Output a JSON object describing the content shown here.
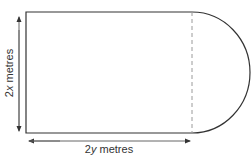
{
  "diagram": {
    "shape": "rectangle with semicircle attached to right side",
    "labels": {
      "height": "2x metres",
      "width": "2y metres"
    },
    "height_label_parts": {
      "coef": "2",
      "var": "x",
      "unit": " metres"
    },
    "width_label_parts": {
      "coef": "2",
      "var": "y",
      "unit": " metres"
    },
    "colors": {
      "stroke": "#333333",
      "dashed": "#999999",
      "arrow": "#555555"
    }
  }
}
